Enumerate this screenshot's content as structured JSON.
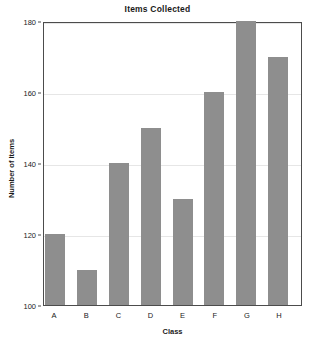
{
  "chart_data": {
    "type": "bar",
    "title": "Items Collected",
    "xlabel": "Class",
    "ylabel": "Number of Items",
    "categories": [
      "A",
      "B",
      "C",
      "D",
      "E",
      "F",
      "G",
      "H"
    ],
    "values": [
      120,
      110,
      140,
      150,
      130,
      160,
      180,
      170
    ],
    "ylim": [
      100,
      180
    ],
    "yticks": [
      100,
      120,
      140,
      160,
      180
    ],
    "ytick_labels": [
      "100",
      "120",
      "140",
      "160",
      "180"
    ],
    "grid": "horizontal",
    "legend": "none",
    "bar_color": "#8e8e8e",
    "grid_color": "#e6e6e6",
    "axis_color": "#4c4c4c",
    "background": "#ffffff"
  }
}
